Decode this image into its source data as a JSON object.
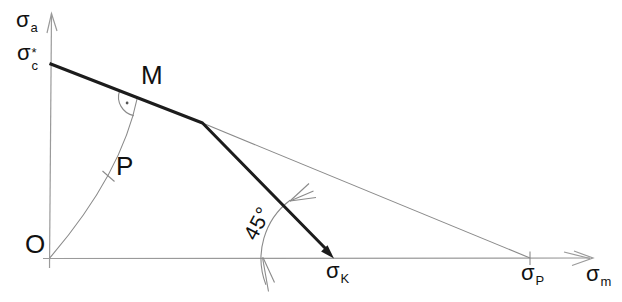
{
  "diagram": {
    "axes": {
      "y": {
        "base": "σ",
        "sub": "a"
      },
      "x": {
        "base": "σ",
        "sub": "m"
      }
    },
    "points": {
      "sigma_c": {
        "base": "σ",
        "sup": "*",
        "sub": "c"
      },
      "origin": "O",
      "M": "M",
      "P": "P",
      "sigma_K": {
        "base": "σ",
        "sub": "K"
      },
      "sigma_P": {
        "base": "σ",
        "sub": "P"
      }
    },
    "annotations": {
      "angle": "45°"
    },
    "colors": {
      "thick_line": "#1c1c1c",
      "thin_line": "#8a8a8a",
      "axis_line": "#9a9a9a",
      "text": "#111111",
      "background": "#ffffff"
    }
  }
}
